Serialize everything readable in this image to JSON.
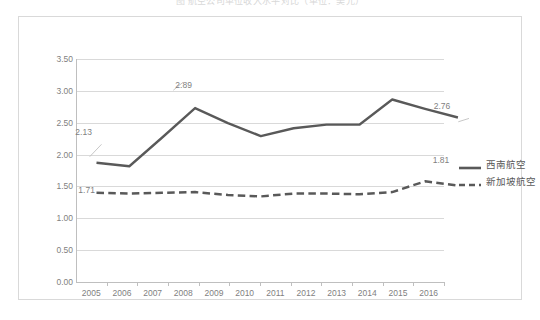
{
  "title_truncated": "图 航空公司单位收入水平对比（单位：美元）",
  "chart_data": {
    "type": "line",
    "title": "",
    "xlabel": "",
    "ylabel": "",
    "ylim": [
      0.0,
      3.5
    ],
    "ytick_step": 0.5,
    "grid": true,
    "legend_position": "right",
    "categories": [
      "2005",
      "2006",
      "2007",
      "2008",
      "2009",
      "2010",
      "2011",
      "2012",
      "2013",
      "2014",
      "2015",
      "2016"
    ],
    "ytick_labels": [
      "0.00",
      "0.50",
      "1.00",
      "1.50",
      "2.00",
      "2.50",
      "3.00",
      "3.50"
    ],
    "series": [
      {
        "name": "西南航空",
        "style": "solid",
        "color": "#595959",
        "values": [
          2.13,
          2.08,
          2.48,
          2.89,
          2.68,
          2.5,
          2.61,
          2.66,
          2.66,
          3.01,
          2.88,
          2.76
        ],
        "labels": [
          {
            "index": 0,
            "text": "2.13"
          },
          {
            "index": 3,
            "text": "2.89"
          },
          {
            "index": 11,
            "text": "2.76"
          }
        ]
      },
      {
        "name": "新加坡航空",
        "style": "dashed",
        "color": "#595959",
        "values": [
          1.71,
          1.7,
          1.71,
          1.72,
          1.68,
          1.66,
          1.7,
          1.7,
          1.69,
          1.72,
          1.87,
          1.81
        ],
        "labels": [
          {
            "index": 0,
            "text": "1.71"
          },
          {
            "index": 11,
            "text": "1.81"
          }
        ]
      }
    ]
  },
  "legend": {
    "entries": [
      {
        "label": "西南航空",
        "style": "solid"
      },
      {
        "label": "新加坡航空",
        "style": "dashed"
      }
    ]
  }
}
